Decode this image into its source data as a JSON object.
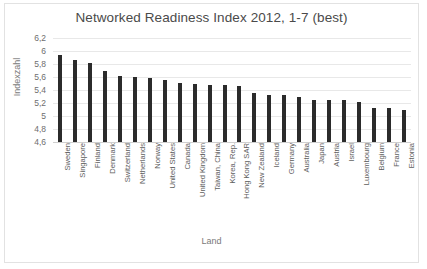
{
  "chart_data": {
    "type": "bar",
    "title": "Networked Readiness Index 2012, 1-7 (best)",
    "xlabel": "Land",
    "ylabel": "Indexzahl",
    "ylim": [
      4.6,
      6.2
    ],
    "ytick_labels": [
      "6,2",
      "6",
      "5,8",
      "5,6",
      "5,4",
      "5,2",
      "5",
      "4,8",
      "4,6"
    ],
    "ytick_values": [
      6.2,
      6.0,
      5.8,
      5.6,
      5.4,
      5.2,
      5.0,
      4.8,
      4.6
    ],
    "grid": true,
    "legend": "none",
    "bar_color": "#2b2b2b",
    "categories": [
      "Sweden",
      "Singapore",
      "Finland",
      "Denmark",
      "Switzerland",
      "Netherlands",
      "Norway",
      "United States",
      "Canada",
      "United Kingdom",
      "Taiwan, China",
      "Korea, Rep.",
      "Hong Kong SAR",
      "New Zealand",
      "Iceland",
      "Germany",
      "Australia",
      "Japan",
      "Austria",
      "Israel",
      "Luxembourg",
      "Belgium",
      "France",
      "Estonia"
    ],
    "values": [
      5.94,
      5.86,
      5.81,
      5.7,
      5.61,
      5.6,
      5.59,
      5.56,
      5.51,
      5.5,
      5.48,
      5.47,
      5.46,
      5.36,
      5.33,
      5.32,
      5.29,
      5.25,
      5.25,
      5.24,
      5.22,
      5.13,
      5.12,
      5.09
    ]
  }
}
